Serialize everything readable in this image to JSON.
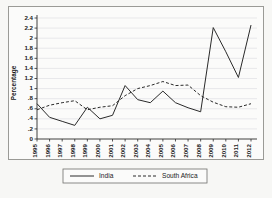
{
  "chart_data": {
    "type": "line",
    "title": "",
    "xlabel": "",
    "ylabel": "Percentage",
    "ylim": [
      0,
      2.4
    ],
    "ytick_labels": [
      "0",
      ".2",
      ".4",
      ".6",
      ".8",
      "1",
      "1.2",
      "1.4",
      "1.6",
      "1.8",
      "2",
      "2.2",
      "2.4"
    ],
    "ytick_values": [
      0,
      0.2,
      0.4,
      0.6,
      0.8,
      1.0,
      1.2,
      1.4,
      1.6,
      1.8,
      2.0,
      2.2,
      2.4
    ],
    "grid": true,
    "legend_position": "bottom",
    "categories": [
      "1995",
      "1996",
      "1997",
      "1998",
      "1999",
      "2000",
      "2001",
      "2002",
      "2003",
      "2004",
      "2005",
      "2006",
      "2007",
      "2008",
      "2009",
      "2010",
      "2011",
      "2012"
    ],
    "series": [
      {
        "name": "India",
        "style": "solid",
        "color": "#2a2a2a",
        "values": [
          0.7,
          0.43,
          0.35,
          0.27,
          0.63,
          0.4,
          0.47,
          1.06,
          0.78,
          0.72,
          0.95,
          0.72,
          0.62,
          0.54,
          2.21,
          1.73,
          1.22,
          2.26
        ]
      },
      {
        "name": "South Africa",
        "style": "dashed",
        "color": "#2a2a2a",
        "values": [
          0.58,
          0.67,
          0.72,
          0.76,
          0.58,
          0.63,
          0.66,
          0.86,
          1.0,
          1.06,
          1.14,
          1.06,
          1.07,
          0.86,
          0.73,
          0.64,
          0.63,
          0.7
        ]
      }
    ]
  },
  "legend": {
    "entries": [
      {
        "label": "India",
        "style": "solid"
      },
      {
        "label": "South Africa",
        "style": "dashed"
      }
    ]
  },
  "colors": {
    "background": "#f7f7f5",
    "plot_background": "#fbfbfa",
    "axis": "#2b2b2b",
    "grid": "#dcdce0",
    "line": "#2a2a2a"
  }
}
